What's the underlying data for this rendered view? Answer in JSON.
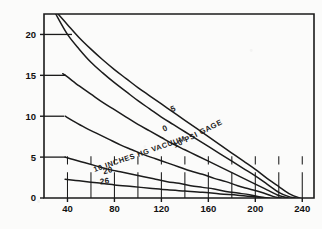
{
  "chart_data": {
    "type": "line",
    "title": "",
    "xlabel": "WATER TEMPERATURE IN DEGREES F",
    "ylabel": "OXYGEN CONTENT IN PPM",
    "xlim": [
      20,
      250
    ],
    "ylim": [
      0,
      22.5
    ],
    "xticks": [
      40,
      80,
      120,
      160,
      200,
      240
    ],
    "xtick_labels": [
      "40",
      "80",
      "120",
      "160",
      "200",
      "240"
    ],
    "yticks": [
      0,
      5,
      10,
      15,
      20
    ],
    "ytick_labels": [
      "0",
      "5",
      "10",
      "15",
      "20"
    ],
    "grid": "partial-lower-left",
    "legend": "inline-curve-labels",
    "series": [
      {
        "name": "10 PSI GAGE",
        "label": "10 PSI GAGE",
        "label_x": 152,
        "label_y": 7.6,
        "x": [
          32,
          40,
          50,
          60,
          70,
          80,
          90,
          100,
          110,
          120,
          130,
          140,
          150,
          160,
          170,
          180,
          190,
          200,
          210,
          220,
          230,
          238
        ],
        "y": [
          22.5,
          21.2,
          19.6,
          18.2,
          16.9,
          15.7,
          14.6,
          13.5,
          12.5,
          11.5,
          10.5,
          9.5,
          8.5,
          7.5,
          6.5,
          5.5,
          4.5,
          3.5,
          2.4,
          1.4,
          0.45,
          0
        ]
      },
      {
        "name": "5 PSI GAGE",
        "label": "5",
        "label_x": 131,
        "label_y": 10.6,
        "x": [
          30,
          40,
          50,
          60,
          70,
          80,
          90,
          100,
          110,
          120,
          130,
          140,
          150,
          160,
          170,
          180,
          190,
          200,
          210,
          220,
          228,
          234
        ],
        "y": [
          22.5,
          20.0,
          18.2,
          16.6,
          15.3,
          14.1,
          13.0,
          11.9,
          10.9,
          9.9,
          9.0,
          8.1,
          7.2,
          6.3,
          5.4,
          4.5,
          3.6,
          2.7,
          1.7,
          0.7,
          0.2,
          0
        ]
      },
      {
        "name": "0 PSI GAGE",
        "label": "0",
        "label_x": 124,
        "label_y": 8.2,
        "x": [
          36,
          40,
          50,
          60,
          70,
          80,
          90,
          100,
          110,
          120,
          130,
          140,
          150,
          160,
          170,
          180,
          190,
          200,
          210,
          220,
          228
        ],
        "y": [
          15.2,
          14.8,
          13.7,
          12.7,
          11.7,
          10.8,
          9.9,
          9.0,
          8.2,
          7.4,
          6.6,
          5.9,
          5.2,
          4.5,
          3.8,
          3.1,
          2.4,
          1.7,
          1.0,
          0.3,
          0
        ]
      },
      {
        "name": "10 INCHES HG VACUUM",
        "label": "10 INCHES HG VACUUM",
        "label_x": 102,
        "label_y": 5.1,
        "x": [
          38,
          45,
          55,
          65,
          75,
          85,
          95,
          105,
          115,
          125,
          135,
          145,
          155,
          165,
          175,
          185,
          195,
          205,
          215,
          222
        ],
        "y": [
          10.0,
          9.4,
          8.6,
          7.9,
          7.2,
          6.5,
          5.9,
          5.3,
          4.8,
          4.3,
          3.8,
          3.3,
          2.9,
          2.4,
          2.0,
          1.5,
          1.1,
          0.7,
          0.2,
          0
        ]
      },
      {
        "name": "20 INCHES HG VACUUM",
        "label": "20",
        "label_x": 75,
        "label_y": 3.05,
        "x": [
          38,
          45,
          55,
          65,
          75,
          85,
          95,
          105,
          115,
          125,
          135,
          145,
          155,
          165,
          175,
          185,
          195,
          205,
          212
        ],
        "y": [
          5.0,
          4.7,
          4.3,
          3.9,
          3.5,
          3.2,
          2.9,
          2.6,
          2.3,
          2.0,
          1.8,
          1.5,
          1.3,
          1.1,
          0.8,
          0.6,
          0.4,
          0.1,
          0
        ]
      },
      {
        "name": "26 INCHES HG VACUUM",
        "label": "26",
        "label_x": 72,
        "label_y": 1.75,
        "x": [
          38,
          50,
          65,
          80,
          95,
          110,
          125,
          140,
          155,
          170,
          185,
          200,
          210
        ],
        "y": [
          2.3,
          2.1,
          1.85,
          1.6,
          1.4,
          1.2,
          1.0,
          0.85,
          0.7,
          0.5,
          0.35,
          0.15,
          0
        ]
      }
    ]
  }
}
